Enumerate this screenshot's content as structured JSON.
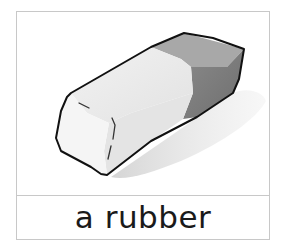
{
  "card": {
    "caption": "a rubber",
    "image": {
      "subject": "eraser-illustration",
      "colors": {
        "outline": "#111111",
        "light_face": "#ebebeb",
        "light_front": "#f4f4f4",
        "dark_top": "#a9a9a9",
        "dark_side": "#7f7f7f",
        "shadow": "#dcdcdc"
      }
    },
    "border_color": "#c8c8c8"
  }
}
